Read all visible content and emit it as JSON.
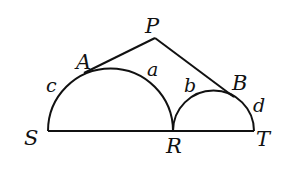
{
  "figure": {
    "type": "geometry",
    "stroke_color": "#111111",
    "background": "#ffffff"
  },
  "points": {
    "P": {
      "label": "P"
    },
    "A": {
      "label": "A"
    },
    "B": {
      "label": "B"
    },
    "S": {
      "label": "S"
    },
    "R": {
      "label": "R"
    },
    "T": {
      "label": "T"
    }
  },
  "arcs": {
    "a": {
      "label": "a"
    },
    "b": {
      "label": "b"
    },
    "c": {
      "label": "c"
    },
    "d": {
      "label": "d"
    }
  },
  "segments": [
    "PA",
    "PB",
    "ST"
  ],
  "semicircles": [
    {
      "diameter": "SR",
      "arcs": [
        "c",
        "a"
      ],
      "tangent_point": "A"
    },
    {
      "diameter": "RT",
      "arcs": [
        "b",
        "d"
      ],
      "tangent_point": "B"
    }
  ]
}
